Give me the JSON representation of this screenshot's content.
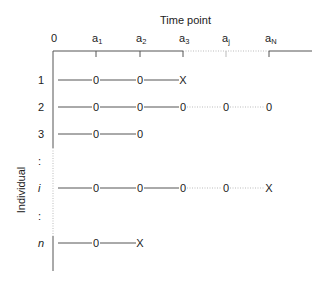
{
  "diagram": {
    "x_axis_title": "Time point",
    "y_axis_title": "Individual",
    "time_points": [
      {
        "base": "0",
        "sub": "",
        "x": 55
      },
      {
        "base": "a",
        "sub": "1",
        "x": 96
      },
      {
        "base": "a",
        "sub": "2",
        "x": 140
      },
      {
        "base": "a",
        "sub": "3",
        "x": 183
      },
      {
        "base": "a",
        "sub": "j",
        "x": 226
      },
      {
        "base": "a",
        "sub": "N",
        "x": 269
      }
    ],
    "rows": [
      {
        "label": "1",
        "italic": false,
        "y": 80,
        "markers": [
          "0",
          "0",
          "X"
        ],
        "dotted_from": null
      },
      {
        "label": "2",
        "italic": false,
        "y": 107,
        "markers": [
          "0",
          "0",
          "0",
          "0",
          "0"
        ],
        "dotted_from": 3
      },
      {
        "label": "3",
        "italic": false,
        "y": 134,
        "markers": [
          "0",
          "0"
        ],
        "dotted_from": null
      },
      {
        "label": ":",
        "italic": false,
        "y": 161,
        "markers": [],
        "dotted_from": null
      },
      {
        "label": "i",
        "italic": true,
        "y": 188,
        "markers": [
          "0",
          "0",
          "0",
          "0",
          "X"
        ],
        "dotted_from": 3
      },
      {
        "label": ":",
        "italic": false,
        "y": 216,
        "markers": [],
        "dotted_from": null
      },
      {
        "label": "n",
        "italic": true,
        "y": 243,
        "markers": [
          "0",
          "X"
        ],
        "dotted_from": null
      }
    ],
    "colors": {
      "line": "#555555",
      "text": "#222222",
      "dotted": "#bbbbbb"
    }
  }
}
